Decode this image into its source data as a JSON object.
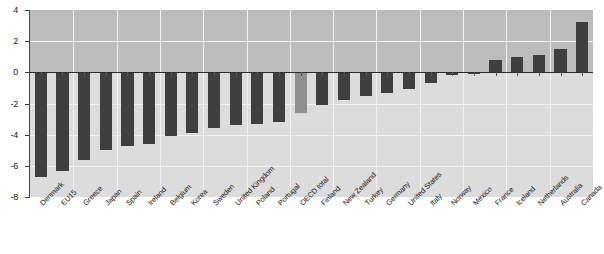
{
  "chart_data": {
    "type": "bar",
    "title": "",
    "xlabel": "",
    "ylabel": "",
    "ylim": [
      -8,
      4
    ],
    "yticks": [
      4,
      2,
      0,
      -2,
      -4,
      -6,
      -8
    ],
    "ytick_labels": [
      "4",
      "2",
      "0",
      "-2",
      "-4",
      "-6",
      "-8"
    ],
    "grid": true,
    "legend": "none",
    "highlight_category": "OECD total",
    "colors": {
      "bar": "#3f3f3f",
      "bar_highlight": "#8f8f8f",
      "plot_background_positive": "#bcbcbc",
      "plot_background_negative": "#dcdcdc",
      "gridline": "#f2f2f2",
      "zero_line": "#2b2b2b",
      "axis": "#4a4a4a",
      "text": "#1a1a1a"
    },
    "categories": [
      "Denmark",
      "EU15",
      "Greece",
      "Japan",
      "Spain",
      "Ireland",
      "Belgium",
      "Korea",
      "Sweden",
      "United Kingdom",
      "Poland",
      "Portugal",
      "OECD total",
      "Finland",
      "New Zealand",
      "Turkey",
      "Germany",
      "United States",
      "Italy",
      "Norway",
      "Mexico",
      "France",
      "Iceland",
      "Netherlands",
      "Australia",
      "Canada"
    ],
    "values": [
      -6.7,
      -6.3,
      -5.6,
      -5.0,
      -4.7,
      -4.6,
      -4.1,
      -3.9,
      -3.6,
      -3.4,
      -3.3,
      -3.2,
      -2.6,
      -2.1,
      -1.8,
      -1.5,
      -1.3,
      -1.1,
      -0.7,
      -0.2,
      -0.1,
      0.8,
      1.0,
      1.1,
      1.5,
      3.2
    ]
  },
  "axis": {
    "y_title": "",
    "x_title": ""
  }
}
